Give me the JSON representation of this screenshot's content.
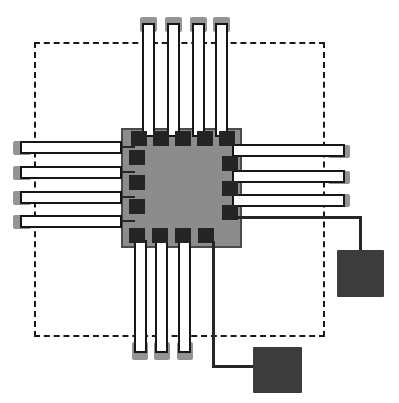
{
  "figure": {
    "canvas": {
      "width": 399,
      "height": 403,
      "background": "#ffffff"
    },
    "colors": {
      "boundary_stroke": "#1a1a1a",
      "die_fill": "#8c8c8c",
      "die_stroke": "#4a4a4a",
      "io_pad_fill": "#949494",
      "trace_fill": "#ffffff",
      "trace_stroke": "#161616",
      "bond_pad_fill": "#242424",
      "line_color": "#262626",
      "contact_square_fill": "#3c3c3c"
    },
    "boundary": {
      "x": 34,
      "y": 42,
      "w": 291,
      "h": 295
    },
    "die": {
      "x": 121,
      "y": 128,
      "w": 121,
      "h": 120
    },
    "io_pads": [
      {
        "side": "top",
        "x": 140,
        "y": 17,
        "w": 17,
        "h": 15
      },
      {
        "side": "top",
        "x": 165,
        "y": 17,
        "w": 17,
        "h": 15
      },
      {
        "side": "top",
        "x": 190,
        "y": 17,
        "w": 17,
        "h": 15
      },
      {
        "side": "top",
        "x": 213,
        "y": 17,
        "w": 17,
        "h": 15
      },
      {
        "side": "left",
        "x": 13,
        "y": 141,
        "w": 18,
        "h": 14
      },
      {
        "side": "left",
        "x": 13,
        "y": 166,
        "w": 18,
        "h": 14
      },
      {
        "side": "left",
        "x": 13,
        "y": 191,
        "w": 18,
        "h": 14
      },
      {
        "side": "left",
        "x": 13,
        "y": 215,
        "w": 18,
        "h": 14
      },
      {
        "side": "right",
        "x": 328,
        "y": 145,
        "w": 22,
        "h": 13
      },
      {
        "side": "right",
        "x": 328,
        "y": 171,
        "w": 22,
        "h": 13
      },
      {
        "side": "right",
        "x": 328,
        "y": 194,
        "w": 22,
        "h": 13
      },
      {
        "side": "bottom",
        "x": 132,
        "y": 342,
        "w": 16,
        "h": 18
      },
      {
        "side": "bottom",
        "x": 154,
        "y": 342,
        "w": 16,
        "h": 18
      },
      {
        "side": "bottom",
        "x": 177,
        "y": 342,
        "w": 16,
        "h": 18
      }
    ],
    "traces": [
      {
        "side": "top",
        "x": 142,
        "y": 23,
        "w": 13,
        "h": 114
      },
      {
        "side": "top",
        "x": 167,
        "y": 23,
        "w": 13,
        "h": 114
      },
      {
        "side": "top",
        "x": 192,
        "y": 23,
        "w": 13,
        "h": 114
      },
      {
        "side": "top",
        "x": 215,
        "y": 23,
        "w": 13,
        "h": 114
      },
      {
        "side": "left",
        "x": 20,
        "y": 141,
        "w": 102,
        "h": 13
      },
      {
        "side": "left",
        "x": 20,
        "y": 166,
        "w": 102,
        "h": 13
      },
      {
        "side": "left",
        "x": 20,
        "y": 191,
        "w": 102,
        "h": 13
      },
      {
        "side": "left",
        "x": 20,
        "y": 215,
        "w": 102,
        "h": 13
      },
      {
        "side": "right",
        "x": 232,
        "y": 144,
        "w": 113,
        "h": 13
      },
      {
        "side": "right",
        "x": 232,
        "y": 170,
        "w": 113,
        "h": 13
      },
      {
        "side": "right",
        "x": 232,
        "y": 194,
        "w": 113,
        "h": 13
      },
      {
        "side": "bottom",
        "x": 134,
        "y": 240,
        "w": 13,
        "h": 113
      },
      {
        "side": "bottom",
        "x": 155,
        "y": 240,
        "w": 13,
        "h": 113
      },
      {
        "side": "bottom",
        "x": 178,
        "y": 240,
        "w": 13,
        "h": 113
      }
    ],
    "lines": [
      {
        "name": "left-stub-1",
        "x": 121,
        "y": 146,
        "w": 14,
        "h": 2
      },
      {
        "name": "left-stub-2",
        "x": 121,
        "y": 171,
        "w": 14,
        "h": 2
      },
      {
        "name": "left-stub-3",
        "x": 121,
        "y": 196,
        "w": 14,
        "h": 2
      },
      {
        "name": "left-stub-4",
        "x": 121,
        "y": 220,
        "w": 14,
        "h": 2
      },
      {
        "name": "right-wire-horizontal",
        "x": 238,
        "y": 216,
        "w": 124,
        "h": 3
      },
      {
        "name": "right-wire-vertical",
        "x": 359,
        "y": 216,
        "w": 3,
        "h": 37
      },
      {
        "name": "bottom-wire-vertical",
        "x": 212,
        "y": 241,
        "w": 3,
        "h": 127
      },
      {
        "name": "bottom-wire-horizontal",
        "x": 212,
        "y": 365,
        "w": 44,
        "h": 3
      }
    ],
    "bond_pads": [
      {
        "side": "top",
        "x": 131,
        "y": 131,
        "w": 16,
        "h": 15
      },
      {
        "side": "top",
        "x": 153,
        "y": 131,
        "w": 16,
        "h": 15
      },
      {
        "side": "top",
        "x": 175,
        "y": 131,
        "w": 16,
        "h": 15
      },
      {
        "side": "top",
        "x": 197,
        "y": 131,
        "w": 16,
        "h": 15
      },
      {
        "side": "top",
        "x": 219,
        "y": 131,
        "w": 16,
        "h": 15
      },
      {
        "side": "left",
        "x": 129,
        "y": 150,
        "w": 16,
        "h": 15
      },
      {
        "side": "left",
        "x": 129,
        "y": 175,
        "w": 16,
        "h": 15
      },
      {
        "side": "left",
        "x": 129,
        "y": 199,
        "w": 16,
        "h": 15
      },
      {
        "side": "right",
        "x": 222,
        "y": 156,
        "w": 16,
        "h": 15
      },
      {
        "side": "right",
        "x": 222,
        "y": 181,
        "w": 16,
        "h": 15
      },
      {
        "side": "right",
        "x": 222,
        "y": 205,
        "w": 16,
        "h": 15
      },
      {
        "side": "bottom",
        "x": 129,
        "y": 228,
        "w": 16,
        "h": 15
      },
      {
        "side": "bottom",
        "x": 152,
        "y": 228,
        "w": 16,
        "h": 15
      },
      {
        "side": "bottom",
        "x": 175,
        "y": 228,
        "w": 16,
        "h": 15
      },
      {
        "side": "bottom",
        "x": 198,
        "y": 228,
        "w": 16,
        "h": 15
      }
    ],
    "contact_squares": [
      {
        "name": "right",
        "x": 337,
        "y": 250,
        "w": 47,
        "h": 47
      },
      {
        "name": "bottom",
        "x": 253,
        "y": 347,
        "w": 49,
        "h": 46
      }
    ]
  }
}
